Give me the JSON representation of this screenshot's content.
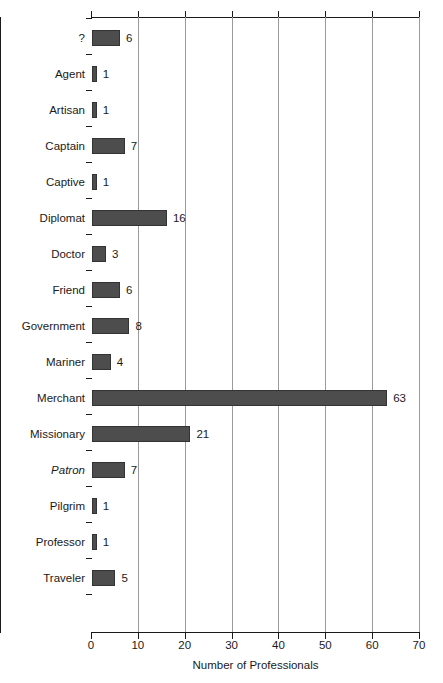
{
  "chart_data": {
    "type": "bar",
    "orientation": "horizontal",
    "title": "",
    "xlabel": "Number of Professionals",
    "ylabel": "",
    "xlim": [
      0,
      70
    ],
    "xticks": [
      0,
      10,
      20,
      30,
      40,
      50,
      60,
      70
    ],
    "grid": "vertical",
    "legend": "none",
    "bar_color": "#4d4d4d",
    "bar_edge_color": "#333333",
    "gridline_color": "#9a9a9a",
    "axis_color": "#1a1a1a",
    "show_value_labels": true,
    "categories": [
      "?",
      "Agent",
      "Artisan",
      "Captain",
      "Captive",
      "Diplomat",
      "Doctor",
      "Friend",
      "Government",
      "Mariner",
      "Merchant",
      "Missionary",
      "Patron",
      "Pilgrim",
      "Professor",
      "Traveler"
    ],
    "values": [
      6,
      1,
      1,
      7,
      1,
      16,
      3,
      6,
      8,
      4,
      63,
      21,
      7,
      1,
      1,
      5
    ],
    "italic_categories": [
      "Patron"
    ],
    "bars": [
      {
        "label": "?",
        "value": 6,
        "value_text": "6",
        "italic": false
      },
      {
        "label": "Agent",
        "value": 1,
        "value_text": "1",
        "italic": false
      },
      {
        "label": "Artisan",
        "value": 1,
        "value_text": "1",
        "italic": false
      },
      {
        "label": "Captain",
        "value": 7,
        "value_text": "7",
        "italic": false
      },
      {
        "label": "Captive",
        "value": 1,
        "value_text": "1",
        "italic": false
      },
      {
        "label": "Diplomat",
        "value": 16,
        "value_text": "16",
        "italic": false
      },
      {
        "label": "Doctor",
        "value": 3,
        "value_text": "3",
        "italic": false
      },
      {
        "label": "Friend",
        "value": 6,
        "value_text": "6",
        "italic": false
      },
      {
        "label": "Government",
        "value": 8,
        "value_text": "8",
        "italic": false
      },
      {
        "label": "Mariner",
        "value": 4,
        "value_text": "4",
        "italic": false
      },
      {
        "label": "Merchant",
        "value": 63,
        "value_text": "63",
        "italic": false
      },
      {
        "label": "Missionary",
        "value": 21,
        "value_text": "21",
        "italic": false
      },
      {
        "label": "Patron",
        "value": 7,
        "value_text": "7",
        "italic": true
      },
      {
        "label": "Pilgrim",
        "value": 1,
        "value_text": "1",
        "italic": false
      },
      {
        "label": "Professor",
        "value": 1,
        "value_text": "1",
        "italic": false
      },
      {
        "label": "Traveler",
        "value": 5,
        "value_text": "5",
        "italic": false
      }
    ],
    "xtick_labels": [
      "0",
      "10",
      "20",
      "30",
      "40",
      "50",
      "60",
      "70"
    ]
  }
}
